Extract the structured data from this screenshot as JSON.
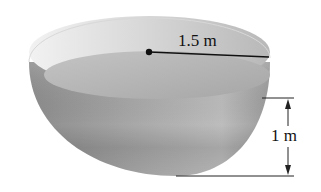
{
  "diagram": {
    "labels": {
      "radius": "1.5 m",
      "water_depth": "1 m"
    },
    "colors": {
      "bowl_outer_light": "#c9c9c9",
      "bowl_outer_dark": "#8a8a8a",
      "bowl_inner": "#dadada",
      "water_surface": "#b3b3b3",
      "lines": "#111111"
    }
  }
}
